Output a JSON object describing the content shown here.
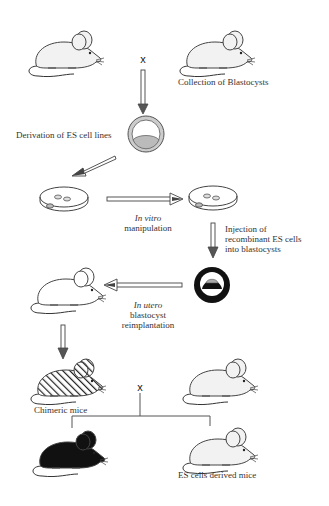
{
  "diagram": {
    "cross_symbol": "x",
    "labels": {
      "collection": "Collection of Blastocysts",
      "derivation": "Derivation of ES cell lines",
      "in_vitro_1": "In vitro",
      "in_vitro_2": "manipulation",
      "injection_1": "Injection of",
      "injection_2": "recombinant ES cells",
      "injection_3": "into blastocysts",
      "in_utero_1": "In utero",
      "in_utero_2": "blastocyst",
      "in_utero_3": "reimplantation",
      "chimeric": "Chimeric mice",
      "es_derived": "ES cells derived mice"
    },
    "nodes": [
      {
        "id": "mouse-parent-1",
        "type": "mouse",
        "fill": "white"
      },
      {
        "id": "mouse-parent-2",
        "type": "mouse",
        "fill": "white"
      },
      {
        "id": "blastocyst-1",
        "type": "blastocyst",
        "fill": "gray"
      },
      {
        "id": "dish-1",
        "type": "petri-dish"
      },
      {
        "id": "dish-2",
        "type": "petri-dish"
      },
      {
        "id": "blastocyst-2",
        "type": "blastocyst",
        "fill": "black"
      },
      {
        "id": "mouse-foster",
        "type": "mouse",
        "fill": "white"
      },
      {
        "id": "mouse-chimeric",
        "type": "mouse",
        "fill": "hatched"
      },
      {
        "id": "mouse-mate",
        "type": "mouse",
        "fill": "white"
      },
      {
        "id": "mouse-black",
        "type": "mouse",
        "fill": "black"
      },
      {
        "id": "mouse-es-derived",
        "type": "mouse",
        "fill": "white"
      }
    ]
  }
}
